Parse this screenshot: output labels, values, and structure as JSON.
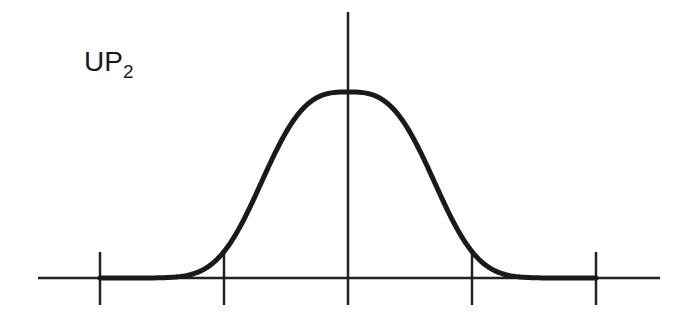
{
  "label": {
    "main": "UP",
    "subscript": "2"
  },
  "chart_data": {
    "type": "line",
    "title": "UP2",
    "x_ticks": [
      -2,
      -1,
      0,
      1,
      2
    ],
    "x_tick_labels": [
      "",
      "",
      "",
      "",
      ""
    ],
    "xlim": [
      -2.5,
      2.5
    ],
    "ylim": [
      0,
      1.4
    ],
    "series": [
      {
        "name": "curve",
        "function": "exp(-(|x|/0.8)^3)",
        "domain": [
          -2,
          2
        ],
        "peak": 1.0
      }
    ],
    "grid": false,
    "legend": "none",
    "colors": {
      "line": "#1a1a1a",
      "axis": "#222222"
    }
  }
}
